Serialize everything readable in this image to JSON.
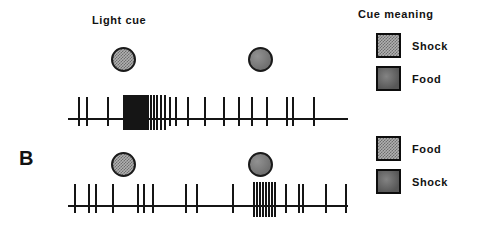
{
  "figure": {
    "panel_label": "B",
    "cue_label": "Light cue",
    "legend_title": "Cue meaning",
    "colors": {
      "ink": "#151515",
      "checkered_fill": "#b0b0b0",
      "checkered_pattern": "#6e6e6e",
      "solid_fill": "#7d7d7d",
      "background": "#ffffff"
    }
  },
  "legend": {
    "title": "Cue meaning",
    "groups": [
      {
        "group_name": "top-trial-legend",
        "entries": [
          {
            "swatch": "checkered",
            "label": "Shock"
          },
          {
            "swatch": "solid",
            "label": "Food"
          }
        ]
      },
      {
        "group_name": "bottom-trial-legend",
        "entries": [
          {
            "swatch": "checkered",
            "label": "Food"
          },
          {
            "swatch": "solid",
            "label": "Shock"
          }
        ]
      }
    ]
  },
  "trials": [
    {
      "trial_name": "top-trial",
      "cues": [
        {
          "cue_name": "cue-1",
          "pattern": "checkered",
          "meaning": "Shock",
          "x": 123,
          "y": 59,
          "d": 25
        },
        {
          "cue_name": "cue-2",
          "pattern": "solid",
          "meaning": "Food",
          "x": 260,
          "y": 59,
          "d": 25
        }
      ],
      "raster": {
        "baseline_y": 119,
        "x_start": 68,
        "x_end": 348,
        "spike_up": 22,
        "spike_down": 7,
        "burst_up": 24,
        "burst_down": 11,
        "spikes": [
          78,
          86,
          107,
          123,
          125,
          127,
          129,
          131,
          133,
          135,
          137,
          139,
          141,
          143,
          145,
          147,
          150,
          153,
          156,
          160,
          164,
          169,
          175,
          187,
          204,
          223,
          238,
          251,
          266,
          286,
          292,
          313
        ],
        "burst_range": [
          123,
          164
        ]
      }
    },
    {
      "trial_name": "bottom-trial",
      "cues": [
        {
          "cue_name": "cue-1",
          "pattern": "checkered",
          "meaning": "Food",
          "x": 123,
          "y": 164,
          "d": 25
        },
        {
          "cue_name": "cue-2",
          "pattern": "solid",
          "meaning": "Shock",
          "x": 260,
          "y": 164,
          "d": 25
        }
      ],
      "raster": {
        "baseline_y": 206,
        "x_start": 68,
        "x_end": 348,
        "spike_up": 22,
        "spike_down": 7,
        "burst_up": 24,
        "burst_down": 11,
        "spikes": [
          74,
          88,
          95,
          112,
          137,
          143,
          152,
          185,
          196,
          232,
          253,
          256,
          259,
          262,
          265,
          268,
          271,
          274,
          285,
          298,
          302,
          325,
          345
        ],
        "burst_range": [
          253,
          274
        ]
      }
    }
  ],
  "labels": {
    "light_cue": {
      "text": "Light cue",
      "x": 92,
      "y": 14
    },
    "panel_b": {
      "text": "B",
      "x": 19,
      "y": 147
    },
    "legend_title_pos": {
      "x": 358,
      "y": 8
    }
  }
}
